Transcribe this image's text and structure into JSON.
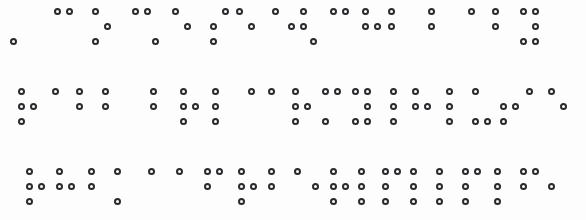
{
  "document": {
    "kind": "braille-text-scan",
    "page_width": 586,
    "page_height": 220,
    "background_color": "#fdfdfd",
    "dot_stroke_color": "#2a2a2e",
    "dot_fill_color": "#fbfbfb",
    "dot_diameter_px": 7,
    "cell_advance_px": 22,
    "line_count": 3
  },
  "braille": {
    "cell_dot_map": {
      "1": "top-left",
      "2": "middle-left",
      "3": "bottom-left",
      "4": "top-right",
      "5": "middle-right",
      "6": "bottom-right"
    },
    "lines": [
      {
        "index": 1,
        "top": 8,
        "left": 22,
        "cells": [
          {
            "x": 10,
            "dots": [
              3
            ]
          },
          {
            "x": 32,
            "dots": []
          },
          {
            "x": 54,
            "dots": [
              1,
              4
            ]
          },
          {
            "x": 76,
            "dots": []
          },
          {
            "x": 92,
            "dots": [
              1,
              5,
              3
            ]
          },
          {
            "x": 118,
            "dots": []
          },
          {
            "x": 132,
            "dots": [
              1,
              4
            ]
          },
          {
            "x": 152,
            "dots": [
              3
            ]
          },
          {
            "x": 172,
            "dots": [
              1,
              5
            ]
          },
          {
            "x": 196,
            "dots": []
          },
          {
            "x": 210,
            "dots": [
              2,
              4,
              3
            ]
          },
          {
            "x": 236,
            "dots": [
              1,
              5
            ]
          },
          {
            "x": 258,
            "dots": []
          },
          {
            "x": 272,
            "dots": [
              1
            ]
          },
          {
            "x": 288,
            "dots": [
              4,
              2,
              5
            ]
          },
          {
            "x": 310,
            "dots": [
              3
            ]
          },
          {
            "x": 330,
            "dots": [
              1,
              4
            ]
          },
          {
            "x": 352,
            "dots": []
          },
          {
            "x": 362,
            "dots": [
              1,
              2,
              5
            ]
          },
          {
            "x": 388,
            "dots": [
              1,
              2
            ]
          },
          {
            "x": 412,
            "dots": []
          },
          {
            "x": 428,
            "dots": [
              1,
              2
            ]
          },
          {
            "x": 452,
            "dots": []
          },
          {
            "x": 468,
            "dots": [
              1
            ]
          },
          {
            "x": 492,
            "dots": [
              1,
              2
            ]
          },
          {
            "x": 520,
            "dots": [
              1,
              4,
              5,
              3,
              6
            ]
          }
        ]
      },
      {
        "index": 2,
        "top": 88,
        "left": 18,
        "cells": [
          {
            "x": 18,
            "dots": [
              1,
              2,
              5,
              3
            ]
          },
          {
            "x": 52,
            "dots": [
              1
            ]
          },
          {
            "x": 76,
            "dots": [
              1,
              2
            ]
          },
          {
            "x": 102,
            "dots": [
              1,
              2
            ]
          },
          {
            "x": 126,
            "dots": []
          },
          {
            "x": 150,
            "dots": [
              1,
              2
            ]
          },
          {
            "x": 180,
            "dots": [
              1,
              2,
              5,
              3
            ]
          },
          {
            "x": 212,
            "dots": [
              1,
              2,
              3
            ]
          },
          {
            "x": 248,
            "dots": [
              1
            ]
          },
          {
            "x": 268,
            "dots": [
              1
            ]
          },
          {
            "x": 292,
            "dots": [
              1,
              2,
              5,
              3
            ]
          },
          {
            "x": 322,
            "dots": [
              1,
              4,
              3
            ]
          },
          {
            "x": 352,
            "dots": [
              1,
              4,
              5,
              3,
              6
            ]
          },
          {
            "x": 390,
            "dots": [
              1,
              2,
              3
            ]
          },
          {
            "x": 412,
            "dots": [
              1,
              2,
              5
            ]
          },
          {
            "x": 446,
            "dots": [
              1,
              2,
              3
            ]
          },
          {
            "x": 472,
            "dots": [
              1,
              3,
              6
            ]
          },
          {
            "x": 500,
            "dots": [
              2,
              5,
              3
            ]
          },
          {
            "x": 526,
            "dots": [
              1
            ]
          },
          {
            "x": 548,
            "dots": [
              1,
              5
            ]
          }
        ]
      },
      {
        "index": 3,
        "top": 168,
        "left": 22,
        "cells": [
          {
            "x": 26,
            "dots": [
              1,
              2,
              5,
              3
            ]
          },
          {
            "x": 56,
            "dots": [
              1,
              2,
              5
            ]
          },
          {
            "x": 88,
            "dots": [
              1,
              2
            ]
          },
          {
            "x": 114,
            "dots": [
              1,
              3
            ]
          },
          {
            "x": 148,
            "dots": [
              1
            ]
          },
          {
            "x": 176,
            "dots": [
              1
            ]
          },
          {
            "x": 204,
            "dots": [
              1,
              4,
              2
            ]
          },
          {
            "x": 238,
            "dots": [
              1,
              2,
              5,
              3
            ]
          },
          {
            "x": 268,
            "dots": [
              1,
              2
            ]
          },
          {
            "x": 294,
            "dots": [
              1
            ]
          },
          {
            "x": 312,
            "dots": [
              2
            ]
          },
          {
            "x": 330,
            "dots": [
              1,
              2,
              5,
              3
            ]
          },
          {
            "x": 358,
            "dots": [
              1,
              2,
              3
            ]
          },
          {
            "x": 382,
            "dots": [
              1,
              4,
              2,
              3
            ]
          },
          {
            "x": 410,
            "dots": [
              1,
              2,
              3
            ]
          },
          {
            "x": 436,
            "dots": [
              1,
              2,
              3
            ]
          },
          {
            "x": 462,
            "dots": [
              1,
              4,
              2,
              3
            ]
          },
          {
            "x": 494,
            "dots": [
              1,
              2,
              3
            ]
          },
          {
            "x": 520,
            "dots": [
              1,
              4,
              2
            ]
          },
          {
            "x": 548,
            "dots": [
              2
            ]
          }
        ]
      }
    ]
  }
}
